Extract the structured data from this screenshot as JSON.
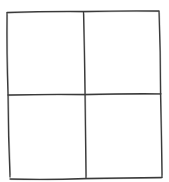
{
  "diagram": {
    "type": "hand-drawn 2x2 grid",
    "rows": 2,
    "cols": 2,
    "stroke_color": "#3a3a3a",
    "background": "#ffffff",
    "cells": [
      {
        "row": 0,
        "col": 0,
        "label": ""
      },
      {
        "row": 0,
        "col": 1,
        "label": ""
      },
      {
        "row": 1,
        "col": 0,
        "label": ""
      },
      {
        "row": 1,
        "col": 1,
        "label": ""
      }
    ]
  }
}
